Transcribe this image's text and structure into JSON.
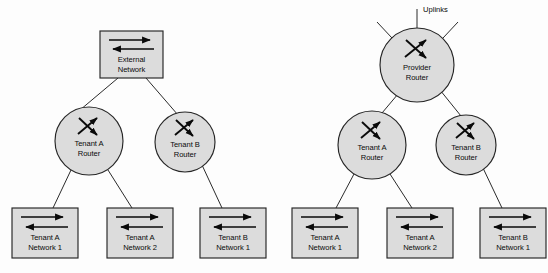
{
  "figure": {
    "background_color": "#fdfdfd",
    "shape_fill": "#dcdcdc",
    "shape_stroke": "#262626",
    "line_color": "#2b2b2b",
    "arrow_color": "#0a0a0a"
  },
  "diagrams": [
    {
      "id": "left",
      "name": "external-network-topology",
      "nodes": {
        "root": {
          "shape": "box",
          "icon": "network-bidirectional-arrows-icon",
          "label_line1": "External",
          "label_line2": "Network",
          "x": 131.5,
          "y": 54.5,
          "width": 63,
          "height": 47
        },
        "routers": [
          {
            "shape": "circle",
            "icon": "router-crossed-arrows-icon",
            "label_line1": "Tenant A",
            "label_line2": "Router",
            "cx": 89,
            "cy": 141,
            "r": 34
          },
          {
            "shape": "circle",
            "icon": "router-crossed-arrows-icon",
            "label_line1": "Tenant B",
            "label_line2": "Router",
            "cx": 185,
            "cy": 142,
            "r": 30
          }
        ],
        "networks": [
          {
            "shape": "box",
            "icon": "network-bidirectional-arrows-icon",
            "label_line1": "Tenant A",
            "label_line2": "Network 1",
            "x": 45,
            "y": 233,
            "width": 66,
            "height": 50
          },
          {
            "shape": "box",
            "icon": "network-bidirectional-arrows-icon",
            "label_line1": "Tenant A",
            "label_line2": "Network 2",
            "x": 140,
            "y": 233,
            "width": 66,
            "height": 50
          },
          {
            "shape": "box",
            "icon": "network-bidirectional-arrows-icon",
            "label_line1": "Tenant B",
            "label_line2": "Network 1",
            "x": 233,
            "y": 233,
            "width": 66,
            "height": 50
          }
        ]
      }
    },
    {
      "id": "right",
      "name": "provider-router-topology",
      "uplinks_label": "Uplinks",
      "uplinks_count": 3,
      "nodes": {
        "root": {
          "shape": "circle",
          "icon": "router-crossed-arrows-icon",
          "label_line1": "Provider",
          "label_line2": "Router",
          "cx": 417,
          "cy": 65,
          "r": 37
        },
        "routers": [
          {
            "shape": "circle",
            "icon": "router-crossed-arrows-icon",
            "label_line1": "Tenant A",
            "label_line2": "Router",
            "cx": 372,
            "cy": 145,
            "r": 34
          },
          {
            "shape": "circle",
            "icon": "router-crossed-arrows-icon",
            "label_line1": "Tenant B",
            "label_line2": "Router",
            "cx": 466,
            "cy": 145,
            "r": 30
          }
        ],
        "networks": [
          {
            "shape": "box",
            "icon": "network-bidirectional-arrows-icon",
            "label_line1": "Tenant A",
            "label_line2": "Network 1",
            "x": 325,
            "y": 233,
            "width": 66,
            "height": 50
          },
          {
            "shape": "box",
            "icon": "network-bidirectional-arrows-icon",
            "label_line1": "Tenant A",
            "label_line2": "Network 2",
            "x": 420,
            "y": 233,
            "width": 66,
            "height": 50
          },
          {
            "shape": "box",
            "icon": "network-bidirectional-arrows-icon",
            "label_line1": "Tenant B",
            "label_line2": "Network 1",
            "x": 513,
            "y": 233,
            "width": 66,
            "height": 50
          }
        ]
      }
    }
  ]
}
